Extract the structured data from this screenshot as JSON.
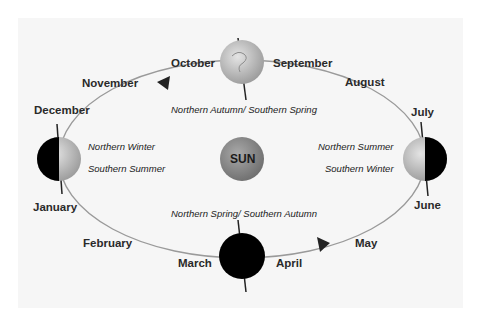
{
  "diagram": {
    "center": {
      "label": "SUN",
      "color": "#8a8a8a"
    },
    "months": [
      {
        "key": "october",
        "label": "October"
      },
      {
        "key": "september",
        "label": "September"
      },
      {
        "key": "november",
        "label": "November"
      },
      {
        "key": "august",
        "label": "August"
      },
      {
        "key": "december",
        "label": "December"
      },
      {
        "key": "july",
        "label": "July"
      },
      {
        "key": "january",
        "label": "January"
      },
      {
        "key": "june",
        "label": "June"
      },
      {
        "key": "february",
        "label": "February"
      },
      {
        "key": "may",
        "label": "May"
      },
      {
        "key": "march",
        "label": "March"
      },
      {
        "key": "april",
        "label": "April"
      }
    ],
    "seasons": {
      "top": "Northern Autumn/ Southern Spring",
      "bottom": "Northern Spring/ Southern Autumn",
      "left_north": "Northern Winter",
      "left_south": "Southern Summer",
      "right_north": "Northern Summer",
      "right_south": "Southern Winter"
    },
    "orbit_direction": "counter-clockwise",
    "colors": {
      "orbit": "#9a9a9a",
      "night_side": "#000000",
      "day_side": "#c8c8c8",
      "background": "#f6f6f6"
    }
  }
}
